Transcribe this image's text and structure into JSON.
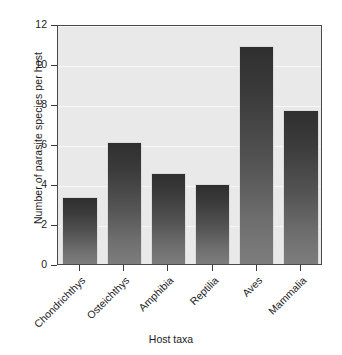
{
  "chart_data": {
    "type": "bar",
    "title": "",
    "xlabel": "Host taxa",
    "ylabel": "Number of parasite species per host",
    "categories": [
      "Chondrichthys",
      "Osteichthys",
      "Amphibia",
      "Reptilia",
      "Aves",
      "Mammalia"
    ],
    "values": [
      3.35,
      6.1,
      4.55,
      4.0,
      10.9,
      7.7
    ],
    "ylim": [
      0,
      12
    ],
    "yticks": [
      0,
      2,
      4,
      6,
      8,
      10,
      12
    ],
    "ytick_labels": [
      "0",
      "2",
      "4",
      "6",
      "8",
      "10",
      "12"
    ],
    "grid": true,
    "legend": null,
    "colors": {
      "bar_top": "#2f2f2f",
      "bar_bottom": "#7d7d7d",
      "plot_background": "#e9e9e9",
      "gridline": "#f7f7f7",
      "frame": "#4a4a4a",
      "text": "#1c1c1c",
      "page_background": "#ffffff"
    }
  }
}
